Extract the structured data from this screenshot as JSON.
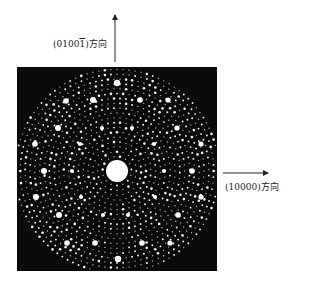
{
  "figure": {
    "type": "electron-diffraction-pattern",
    "background_color": "#ffffff",
    "pattern_bg_color": "#0a0a0a",
    "spot_color": "#ffffff",
    "pattern_box": {
      "x": 17,
      "y": 67,
      "width": 200,
      "height": 204
    },
    "center": {
      "x": 117,
      "y": 171,
      "r": 11
    },
    "vertical_axis": {
      "label": "(01001̄)方向",
      "label_parts": [
        "(0100",
        "1",
        ")方向"
      ],
      "arrow": {
        "x": 115,
        "y1": 62,
        "y2": 15
      },
      "label_pos": {
        "x": 53,
        "y": 37
      }
    },
    "horizontal_axis": {
      "label": "(10000)方向",
      "arrow": {
        "y": 173,
        "x1": 223,
        "x2": 268
      },
      "label_pos": {
        "x": 225,
        "y": 180
      }
    },
    "strong_spots": [
      {
        "x": 117,
        "y": 83,
        "r": 3.2
      },
      {
        "x": 118,
        "y": 259,
        "r": 3.2
      },
      {
        "x": 66,
        "y": 101,
        "r": 2.8
      },
      {
        "x": 93,
        "y": 100,
        "r": 3.0
      },
      {
        "x": 140,
        "y": 100,
        "r": 2.8
      },
      {
        "x": 168,
        "y": 100,
        "r": 2.6
      },
      {
        "x": 58,
        "y": 128,
        "r": 3.0
      },
      {
        "x": 177,
        "y": 128,
        "r": 2.6
      },
      {
        "x": 35,
        "y": 144,
        "r": 2.8
      },
      {
        "x": 201,
        "y": 144,
        "r": 2.6
      },
      {
        "x": 44,
        "y": 171,
        "r": 3.0
      },
      {
        "x": 192,
        "y": 171,
        "r": 2.8
      },
      {
        "x": 36,
        "y": 197,
        "r": 3.0
      },
      {
        "x": 201,
        "y": 197,
        "r": 2.6
      },
      {
        "x": 59,
        "y": 215,
        "r": 3.0
      },
      {
        "x": 178,
        "y": 215,
        "r": 2.8
      },
      {
        "x": 67,
        "y": 243,
        "r": 2.8
      },
      {
        "x": 95,
        "y": 243,
        "r": 2.8
      },
      {
        "x": 142,
        "y": 243,
        "r": 2.8
      },
      {
        "x": 170,
        "y": 243,
        "r": 2.6
      }
    ],
    "medium_spots": [
      {
        "x": 102,
        "y": 128
      },
      {
        "x": 132,
        "y": 128
      },
      {
        "x": 80,
        "y": 144
      },
      {
        "x": 154,
        "y": 144
      },
      {
        "x": 72,
        "y": 171
      },
      {
        "x": 164,
        "y": 171
      },
      {
        "x": 81,
        "y": 197
      },
      {
        "x": 155,
        "y": 197
      },
      {
        "x": 103,
        "y": 215
      },
      {
        "x": 128,
        "y": 215
      }
    ],
    "lattice": {
      "symmetry": 10,
      "base_spacing": 6.2,
      "seed": 7
    }
  }
}
